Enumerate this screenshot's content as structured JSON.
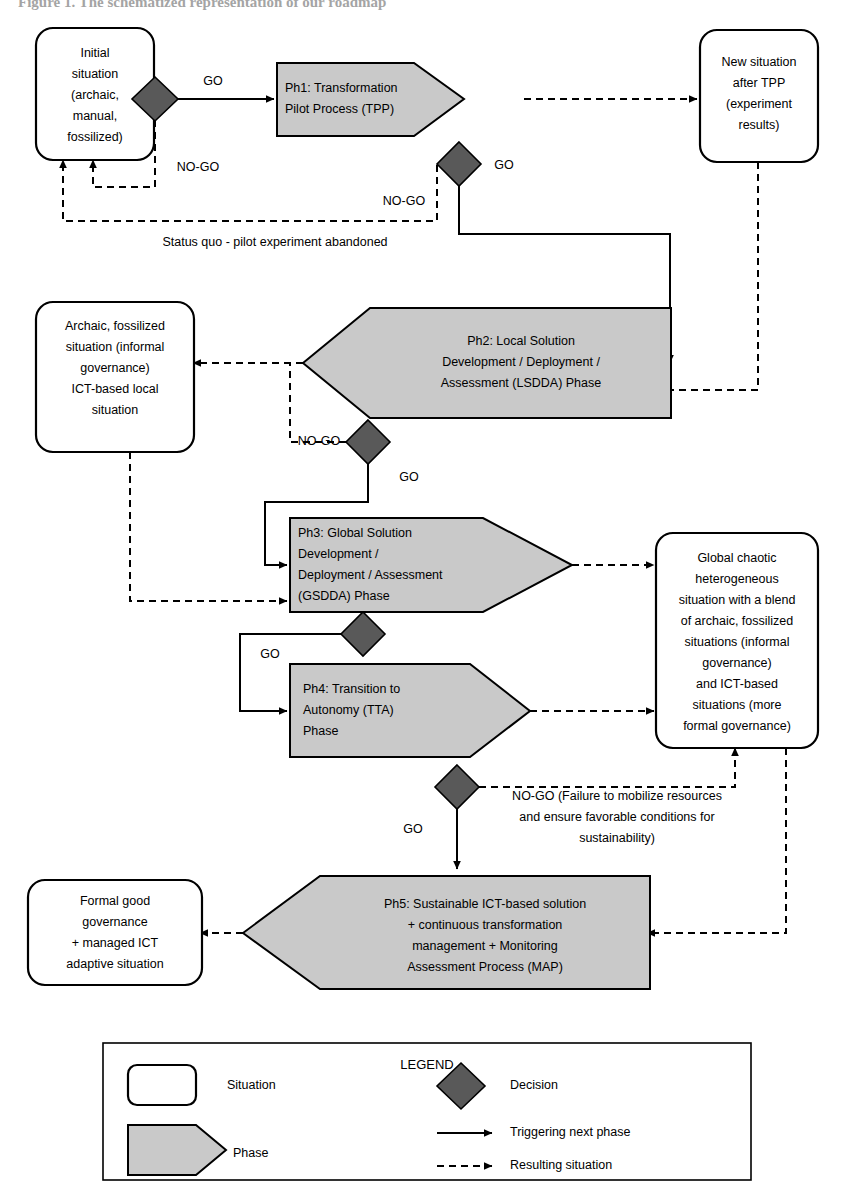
{
  "figure": {
    "title": "Figure 1. The schematized representation of our roadmap",
    "type": "flowchart",
    "colors": {
      "phase_fill": "#c9c9c9",
      "situation_fill": "#ffffff",
      "decision_fill": "#595959",
      "stroke": "#000000",
      "background": "#ffffff"
    }
  },
  "nodes": {
    "initial_situation": {
      "kind": "situation",
      "lines": [
        "Initial",
        "situation",
        "(archaic,",
        "manual,",
        "fossilized)"
      ]
    },
    "new_situation_tpp": {
      "kind": "situation",
      "lines": [
        "New situation",
        "after TPP",
        "(experiment",
        "results)"
      ]
    },
    "archaic_local": {
      "kind": "situation",
      "lines": [
        "Archaic, fossilized",
        "situation (informal",
        "governance)",
        "ICT-based local",
        "situation"
      ]
    },
    "global_chaotic": {
      "kind": "situation",
      "lines": [
        "Global chaotic",
        "heterogeneous",
        "situation with a blend",
        "of  archaic, fossilized",
        "situations (informal",
        "governance)",
        "and ICT-based",
        "situations (more",
        "formal governance)"
      ]
    },
    "formal_good_governance": {
      "kind": "situation",
      "lines": [
        "Formal good",
        "governance",
        "+ managed ICT",
        "adaptive situation"
      ]
    },
    "ph1": {
      "kind": "phase",
      "lines": [
        "Ph1: Transformation",
        "Pilot Process (TPP)"
      ]
    },
    "ph2": {
      "kind": "phase",
      "lines": [
        "Ph2: Local Solution",
        "Development / Deployment /",
        "Assessment (LSDDA) Phase"
      ]
    },
    "ph3": {
      "kind": "phase",
      "lines": [
        "Ph3: Global Solution",
        "Development /",
        "Deployment / Assessment",
        "(GSDDA) Phase"
      ]
    },
    "ph4": {
      "kind": "phase",
      "lines": [
        "Ph4: Transition to",
        "Autonomy (TTA)",
        "Phase"
      ]
    },
    "ph5": {
      "kind": "phase",
      "lines": [
        "Ph5: Sustainable ICT-based solution",
        "+ continuous transformation",
        "management + Monitoring",
        "Assessment Process (MAP)"
      ]
    },
    "decision_d1": {
      "kind": "decision"
    },
    "decision_d2": {
      "kind": "decision"
    },
    "decision_d3": {
      "kind": "decision"
    },
    "decision_d4": {
      "kind": "decision"
    },
    "decision_d5": {
      "kind": "decision"
    }
  },
  "edge_labels": {
    "go_1": "GO",
    "nogo_1": "NO-GO",
    "go_2": "GO",
    "nogo_2": "NO-GO",
    "status_quo": "Status quo - pilot experiment abandoned",
    "nogo_3": "NO-GO",
    "go_3": "GO",
    "go_4": "GO",
    "go_5": "GO",
    "nogo_5_l1": "NO-GO (Failure to mobilize resources",
    "nogo_5_l2": "and ensure favorable conditions for",
    "nogo_5_l3": "sustainability)"
  },
  "legend": {
    "title": "LEGEND",
    "items": [
      {
        "key": "situation",
        "label": "Situation",
        "symbol": "rounded-rect"
      },
      {
        "key": "phase",
        "label": "Phase",
        "symbol": "pentagon-arrow"
      },
      {
        "key": "decision",
        "label": "Decision",
        "symbol": "diamond"
      },
      {
        "key": "trigger",
        "label": "Triggering next phase",
        "symbol": "solid-arrow"
      },
      {
        "key": "result",
        "label": "Resulting situation",
        "symbol": "dashed-arrow"
      }
    ]
  }
}
